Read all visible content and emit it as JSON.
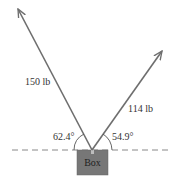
{
  "diagram": {
    "object": {
      "label": "Box",
      "color": "#777777"
    },
    "forces": [
      {
        "name": "left-force",
        "magnitude_label": "150 lb",
        "angle_label": "62.4°"
      },
      {
        "name": "right-force",
        "magnitude_label": "114 lb",
        "angle_label": "54.9°"
      }
    ],
    "colors": {
      "arrow": "#6e6e6e",
      "dashed_line": "#888888",
      "text": "#333333"
    }
  }
}
